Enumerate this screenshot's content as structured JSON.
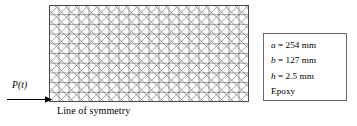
{
  "figure": {
    "mesh": {
      "name": "finite-element-mesh",
      "columns": 20,
      "rows": 10,
      "pattern": "triangulated-quad-diagonals",
      "line_color": "#555555",
      "border_color": "#4a4a4a"
    },
    "load": {
      "label": "P(t)",
      "arrow_direction": "right",
      "color": "#000000"
    },
    "symmetry": {
      "label": "Line of symmetry"
    },
    "properties": {
      "border_color": "#6b6b6b",
      "lines": [
        {
          "symbol": "a",
          "relation": " = 254 mm"
        },
        {
          "symbol": "b",
          "relation": " = 127 mm"
        },
        {
          "symbol": "h",
          "relation": " = 2.5 mm"
        },
        {
          "symbol": "",
          "relation": "Epoxy"
        }
      ]
    }
  }
}
